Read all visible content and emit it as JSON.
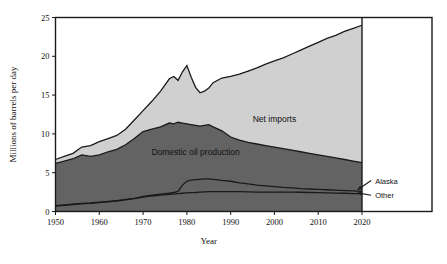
{
  "chart_data": {
    "type": "area",
    "subtype": "stacked-area",
    "title": "",
    "xlabel": "Year",
    "ylabel": "Millions of barrels per day",
    "xlim": [
      1950,
      2020
    ],
    "ylim": [
      0,
      25
    ],
    "xticks": [
      1950,
      1960,
      1970,
      1980,
      1990,
      2000,
      2010,
      2020
    ],
    "yticks": [
      0,
      5,
      10,
      15,
      20,
      25
    ],
    "grid": false,
    "legend_position": "inline-annotations",
    "frame_right_year": 2036,
    "x": [
      1950,
      1952,
      1954,
      1956,
      1958,
      1960,
      1962,
      1964,
      1966,
      1968,
      1970,
      1972,
      1974,
      1976,
      1977,
      1978,
      1979,
      1980,
      1981,
      1982,
      1983,
      1984,
      1985,
      1986,
      1988,
      1990,
      1992,
      1994,
      1996,
      1998,
      2000,
      2002,
      2004,
      2006,
      2008,
      2010,
      2012,
      2014,
      2016,
      2018,
      2020
    ],
    "series": [
      {
        "name": "Other",
        "label": "Other",
        "color": "#636363",
        "values": [
          0.7,
          0.8,
          0.9,
          1.0,
          1.05,
          1.15,
          1.25,
          1.35,
          1.5,
          1.65,
          1.85,
          2.0,
          2.1,
          2.2,
          2.25,
          2.3,
          2.35,
          2.4,
          2.42,
          2.45,
          2.5,
          2.52,
          2.55,
          2.55,
          2.55,
          2.55,
          2.55,
          2.52,
          2.5,
          2.5,
          2.5,
          2.5,
          2.5,
          2.48,
          2.45,
          2.42,
          2.4,
          2.38,
          2.35,
          2.3,
          2.3
        ]
      },
      {
        "name": "Alaska",
        "label": "Alaska",
        "color": "#636363",
        "cumulative_top": [
          0.75,
          0.85,
          0.95,
          1.05,
          1.1,
          1.2,
          1.3,
          1.4,
          1.55,
          1.7,
          1.95,
          2.1,
          2.25,
          2.35,
          2.45,
          2.6,
          3.4,
          3.9,
          4.05,
          4.1,
          4.15,
          4.2,
          4.2,
          4.15,
          4.0,
          3.9,
          3.7,
          3.55,
          3.4,
          3.3,
          3.2,
          3.1,
          3.05,
          2.95,
          2.9,
          2.85,
          2.8,
          2.75,
          2.7,
          2.65,
          2.6
        ]
      },
      {
        "name": "Domestic oil production",
        "label": "Domestic oil production",
        "color": "#636363",
        "cumulative_top": [
          6.2,
          6.5,
          6.8,
          7.3,
          7.1,
          7.3,
          7.7,
          8.0,
          8.6,
          9.4,
          10.3,
          10.6,
          10.9,
          11.4,
          11.3,
          11.5,
          11.4,
          11.3,
          11.2,
          11.1,
          11.0,
          11.1,
          11.2,
          10.9,
          10.4,
          9.6,
          9.2,
          8.9,
          8.7,
          8.5,
          8.3,
          8.1,
          7.9,
          7.7,
          7.5,
          7.3,
          7.1,
          6.9,
          6.7,
          6.5,
          6.3
        ]
      },
      {
        "name": "Net imports",
        "label": "Net imports",
        "color": "#d0d0d0",
        "cumulative_top": [
          6.7,
          7.1,
          7.5,
          8.3,
          8.5,
          9.0,
          9.4,
          9.8,
          10.6,
          11.8,
          13.0,
          14.2,
          15.5,
          17.1,
          17.4,
          16.9,
          18.0,
          18.8,
          17.3,
          16.0,
          15.3,
          15.5,
          15.9,
          16.6,
          17.2,
          17.4,
          17.7,
          18.1,
          18.5,
          19.0,
          19.4,
          19.8,
          20.3,
          20.8,
          21.3,
          21.8,
          22.3,
          22.7,
          23.2,
          23.6,
          24.0
        ]
      }
    ],
    "annotations": [
      {
        "text": "Net imports",
        "year": 2000,
        "value": 11.5,
        "style": "series-label"
      },
      {
        "text": "Domestic oil production",
        "year": 1982,
        "value": 7.3,
        "style": "series-label"
      },
      {
        "text": "Alaska",
        "year": 2023,
        "value": 3.6,
        "style": "callout-label",
        "arrow_to_year": 2019,
        "arrow_to_value": 2.8
      },
      {
        "text": "Other",
        "year": 2023,
        "value": 1.7,
        "style": "callout-label",
        "arrow_to_year": 2019,
        "arrow_to_value": 2.4
      }
    ]
  },
  "axis": {
    "y_title": "Millions of barrels per day",
    "x_title": "Year",
    "y_tick_labels": [
      "0",
      "5",
      "10",
      "15",
      "20",
      "25"
    ],
    "x_tick_labels": [
      "1950",
      "1960",
      "1970",
      "1980",
      "1990",
      "2000",
      "2010",
      "2020"
    ]
  },
  "colors": {
    "net_imports_fill": "#d0d0d0",
    "production_fill": "#636363",
    "frame": "#1a1a1a",
    "background": "#ffffff"
  }
}
